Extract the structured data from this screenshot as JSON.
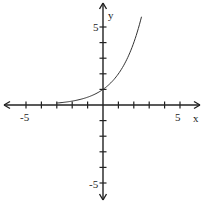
{
  "chart_data": {
    "type": "line",
    "title": "",
    "xlabel": "x",
    "ylabel": "y",
    "xlim": [
      -6.5,
      6.5
    ],
    "ylim": [
      -6.5,
      6.5
    ],
    "grid": false,
    "x_tick_labels": [
      "-5",
      "5"
    ],
    "y_tick_labels": [
      "5",
      "-5"
    ],
    "series": [
      {
        "name": "y = 2^x",
        "x": [
          -3,
          -2.5,
          -2,
          -1.5,
          -1,
          -0.5,
          0,
          0.5,
          1,
          1.5,
          2,
          2.5
        ],
        "values": [
          0.125,
          0.177,
          0.25,
          0.354,
          0.5,
          0.707,
          1,
          1.414,
          2,
          2.828,
          4,
          5.657
        ]
      }
    ]
  },
  "labels": {
    "x_axis": "x",
    "y_axis": "y",
    "x_neg5": "-5",
    "x_pos5": "5",
    "y_pos5": "5",
    "y_neg5": "-5"
  }
}
